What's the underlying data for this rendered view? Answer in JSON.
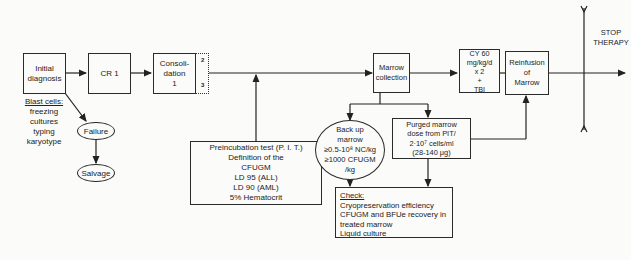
{
  "nodes": {
    "initial_diagnosis": "Initial\ndiagnosis",
    "cr1": "CR 1",
    "consolidation": "Consoli-\ndation\n1",
    "consolidation_marks": [
      "2",
      "3"
    ],
    "marrow_collection": "Marrow\ncollection",
    "conditioning": "CY 60 mg/kg/d\nx 2\n+\nTBI",
    "reinfusion": "Reinfusion\nof\nMarrow",
    "stop_therapy": "STOP\nTHERAPY",
    "failure": "Failure",
    "salvage": "Salvage",
    "pit_box": "Preincubation test (P. I. T.)\nDefinition of the\nCFUGM\nLD 95 (ALL)\nLD 90 (AML)\n5% Hematocrit",
    "purged_marrow": "Purged marrow\ndose from PIT/\n2·10⁷ cells/ml\n(28-140 μg)"
  },
  "blast_cells": {
    "heading": "Blast cells:",
    "items": [
      "freezing",
      "cultures",
      "typing",
      "karyotype"
    ]
  },
  "backup_marrow": {
    "lines": [
      "Back up",
      "marrow",
      "≥0.5-10⁸ NC/kg",
      "≥1000 CFUGM",
      "/kg"
    ]
  },
  "check_box": {
    "heading": "Check:",
    "items": [
      "Cryopreservation efficiency",
      "CFUGM and BFUe recovery in",
      "treated marrow",
      "Liquid culture"
    ]
  }
}
